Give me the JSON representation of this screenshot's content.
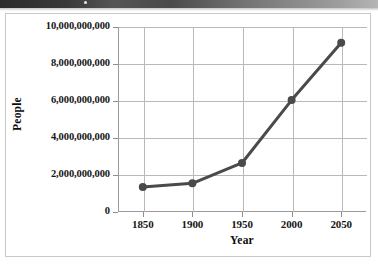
{
  "page": {
    "background_color": "#ffffff",
    "border_color": "#c9c9c9",
    "header_strip": {
      "name": "page-header-strip",
      "color_left": "#2b2b2b",
      "color_right": "#b5b5b5"
    }
  },
  "chart_data": {
    "type": "line",
    "title": "",
    "xlabel": "Year",
    "ylabel": "People",
    "x": [
      1850,
      1900,
      1950,
      2000,
      2050
    ],
    "xtick_labels": [
      "1850",
      "1900",
      "1950",
      "2000",
      "2050"
    ],
    "values": [
      1350000000,
      1550000000,
      2650000000,
      6050000000,
      9150000000
    ],
    "ytick_values": [
      0,
      2000000000,
      4000000000,
      6000000000,
      8000000000,
      10000000000
    ],
    "ytick_labels": [
      "0",
      "2,000,000,000",
      "4,000,000,000",
      "6,000,000,000",
      "8,000,000,000",
      "10,000,000,000"
    ],
    "xlim": [
      1825,
      2075
    ],
    "ylim": [
      0,
      10000000000
    ],
    "grid": true,
    "legend": false,
    "series_color": "#4a4a4a",
    "grid_color": "#b9b9b9",
    "axis_color": "#9a9a9a",
    "marker": "circle",
    "line_width": 3
  }
}
